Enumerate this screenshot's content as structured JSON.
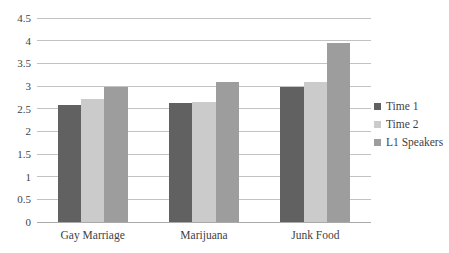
{
  "chart_data": {
    "type": "bar",
    "title": "",
    "xlabel": "",
    "ylabel": "",
    "categories": [
      "Gay Marriage",
      "Marijuana",
      "Junk Food"
    ],
    "series": [
      {
        "name": "Time 1",
        "color": "#616161",
        "values": [
          2.57,
          2.62,
          2.98
        ]
      },
      {
        "name": "Time 2",
        "color": "#cbcbcb",
        "values": [
          2.72,
          2.65,
          3.09
        ]
      },
      {
        "name": "L1 Speakers",
        "color": "#9d9d9d",
        "values": [
          2.97,
          3.09,
          3.94
        ]
      }
    ],
    "ylim": [
      0,
      4.5
    ],
    "ytick_step": 0.5,
    "ytick_labels": [
      "0",
      "0.5",
      "1",
      "1.5",
      "2",
      "2.5",
      "3",
      "3.5",
      "4",
      "4.5"
    ],
    "grid": true,
    "legend_position": "right",
    "legend": [
      "Time 1",
      "Time 2",
      "L1 Speakers"
    ]
  },
  "colors": {
    "background": "#ffffff",
    "gridline": "#c3c3c3",
    "axis": "#a9a9a9",
    "text": "#3f3f3f"
  }
}
